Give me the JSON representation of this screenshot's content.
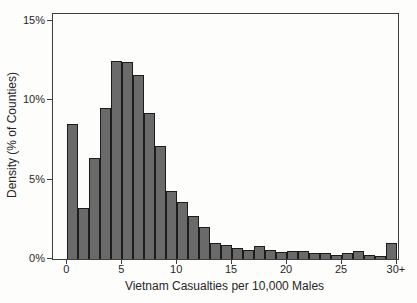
{
  "figure": {
    "background_color": "#fdfdfc",
    "bar_fill_color": "#6a6a6a",
    "bar_edge_color": "#1c1c1c",
    "frame_color": "#3f3f3f",
    "text_color": "#262626"
  },
  "chart_data": {
    "type": "bar",
    "subtype": "histogram",
    "title": "",
    "xlabel": "Vietnam Casualties per 10,000 Males",
    "ylabel": "Density (% of Counties)",
    "bin_start": 0,
    "bin_width": 1,
    "categories": [
      "0-1",
      "1-2",
      "2-3",
      "3-4",
      "4-5",
      "5-6",
      "6-7",
      "7-8",
      "8-9",
      "9-10",
      "10-11",
      "11-12",
      "12-13",
      "13-14",
      "14-15",
      "15-16",
      "16-17",
      "17-18",
      "18-19",
      "19-20",
      "20-21",
      "21-22",
      "22-23",
      "23-24",
      "24-25",
      "25-26",
      "26-27",
      "27-28",
      "28-29",
      "30+"
    ],
    "values": [
      8.5,
      3.2,
      6.4,
      9.5,
      12.5,
      12.4,
      11.6,
      9.2,
      7.1,
      4.3,
      3.6,
      2.7,
      2.0,
      1.0,
      0.9,
      0.7,
      0.55,
      0.8,
      0.55,
      0.45,
      0.5,
      0.5,
      0.35,
      0.35,
      0.25,
      0.35,
      0.5,
      0.25,
      0.2,
      1.0
    ],
    "values_unit": "% of Counties",
    "x_ticks": [
      {
        "value": 0,
        "label": "0"
      },
      {
        "value": 5,
        "label": "5"
      },
      {
        "value": 10,
        "label": "10"
      },
      {
        "value": 15,
        "label": "15"
      },
      {
        "value": 20,
        "label": "20"
      },
      {
        "value": 25,
        "label": "25"
      },
      {
        "value": 30,
        "label": "30+"
      }
    ],
    "y_ticks": [
      {
        "value": 0,
        "label": "0%"
      },
      {
        "value": 5,
        "label": "5%"
      },
      {
        "value": 10,
        "label": "10%"
      },
      {
        "value": 15,
        "label": "15%"
      }
    ],
    "xlim": [
      -1.3,
      30.1
    ],
    "ylim": [
      0,
      15.45
    ],
    "grid": false,
    "legend": "none"
  }
}
